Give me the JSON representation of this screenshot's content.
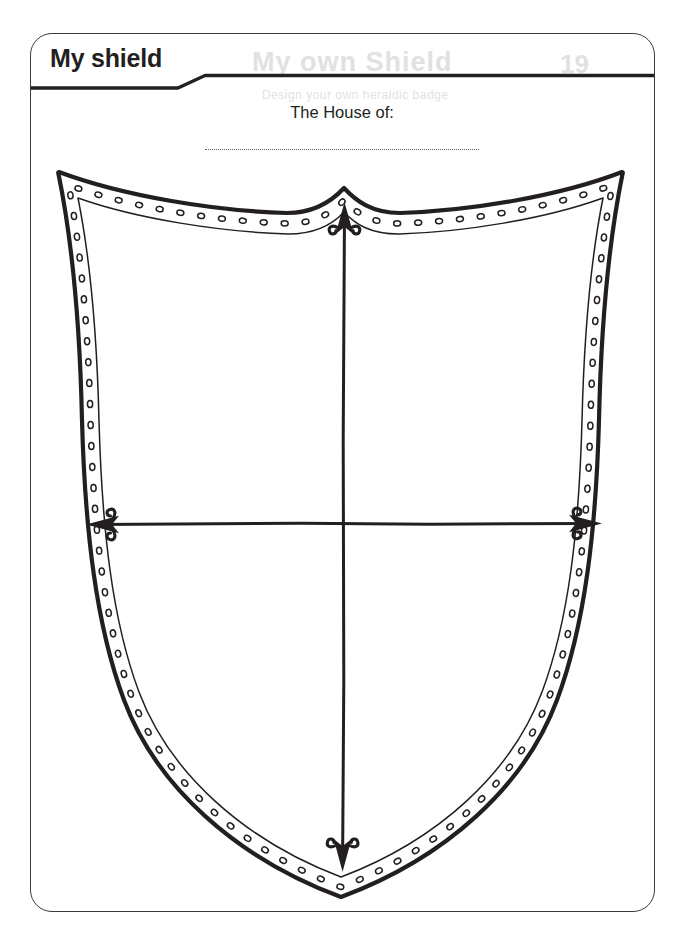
{
  "page": {
    "title": "My shield",
    "background_color": "#ffffff",
    "ink_color": "#231f20",
    "frame_color": "#3a3a3c"
  },
  "header": {
    "title": "My shield",
    "divider": "stepped-rule"
  },
  "ghost_text": {
    "note": "faint show-through from reverse of page",
    "line_a": "My own Shield",
    "line_b": "Design your own heraldic badge",
    "line_c": "19"
  },
  "prompt": {
    "label": "The House of:",
    "answer_value": "",
    "answer_placeholder": ""
  },
  "shield": {
    "name": "heraldic-shield",
    "style": "double-outline-with-rivets",
    "rivet_count_approx": 96,
    "outline_color": "#231f20",
    "fill_color": "#ffffff",
    "bounds": {
      "left": 58,
      "top": 170,
      "right": 630,
      "bottom": 898
    },
    "top_peak_x": 344,
    "bottom_point_x": 341
  },
  "dividers": {
    "center_x": 344,
    "center_y": 524,
    "vertical": {
      "name": "vertical-divider",
      "top": 205,
      "bottom": 868,
      "arrowheads": [
        "up",
        "down"
      ]
    },
    "horizontal": {
      "name": "horizontal-divider",
      "left": 88,
      "right": 600,
      "arrowheads": [
        "left",
        "right"
      ]
    },
    "arrow_style": "curled-barb"
  }
}
